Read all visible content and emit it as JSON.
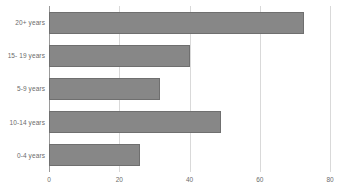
{
  "chart_data": {
    "type": "bar",
    "orientation": "horizontal",
    "title": "",
    "xlabel": "",
    "ylabel": "",
    "categories": [
      "20+ years",
      "15- 19 years",
      "5-9 years",
      "10-14 years",
      "0-4 years"
    ],
    "values": [
      72.5,
      40,
      31.5,
      49,
      26
    ],
    "series": [
      {
        "name": "",
        "values": [
          72.5,
          40,
          31.5,
          49,
          26
        ]
      }
    ],
    "xlim": [
      0,
      80
    ],
    "xticks": [
      0,
      20,
      40,
      60,
      80
    ],
    "xtick_labels": [
      "0",
      "20",
      "40",
      "60",
      "80"
    ],
    "grid": true,
    "grid_axis": "x",
    "legend": false,
    "bar_color": "#878787",
    "bar_border_color": "#6f6f6f",
    "gridline_color": "#d9d9d9",
    "axis_color": "#9a9a9a",
    "text_color": "#6b6b6b"
  }
}
